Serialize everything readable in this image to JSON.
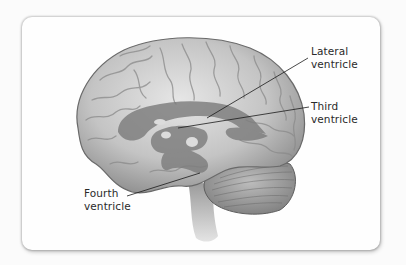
{
  "figure": {
    "labels": {
      "lateral": {
        "line1": "Lateral",
        "line2": "ventricle"
      },
      "third": {
        "line1": "Third",
        "line2": "ventricle"
      },
      "fourth": {
        "line1": "Fourth",
        "line2": "ventricle"
      }
    },
    "colors": {
      "card": "#fefefe",
      "brain_light": "#d8d8d8",
      "brain_mid": "#a9a9a9",
      "brain_dark": "#6e6e6e",
      "ventricle": "#7d7d7d",
      "leader_line": "#1a1a1a",
      "text": "#2a2a2a"
    }
  }
}
